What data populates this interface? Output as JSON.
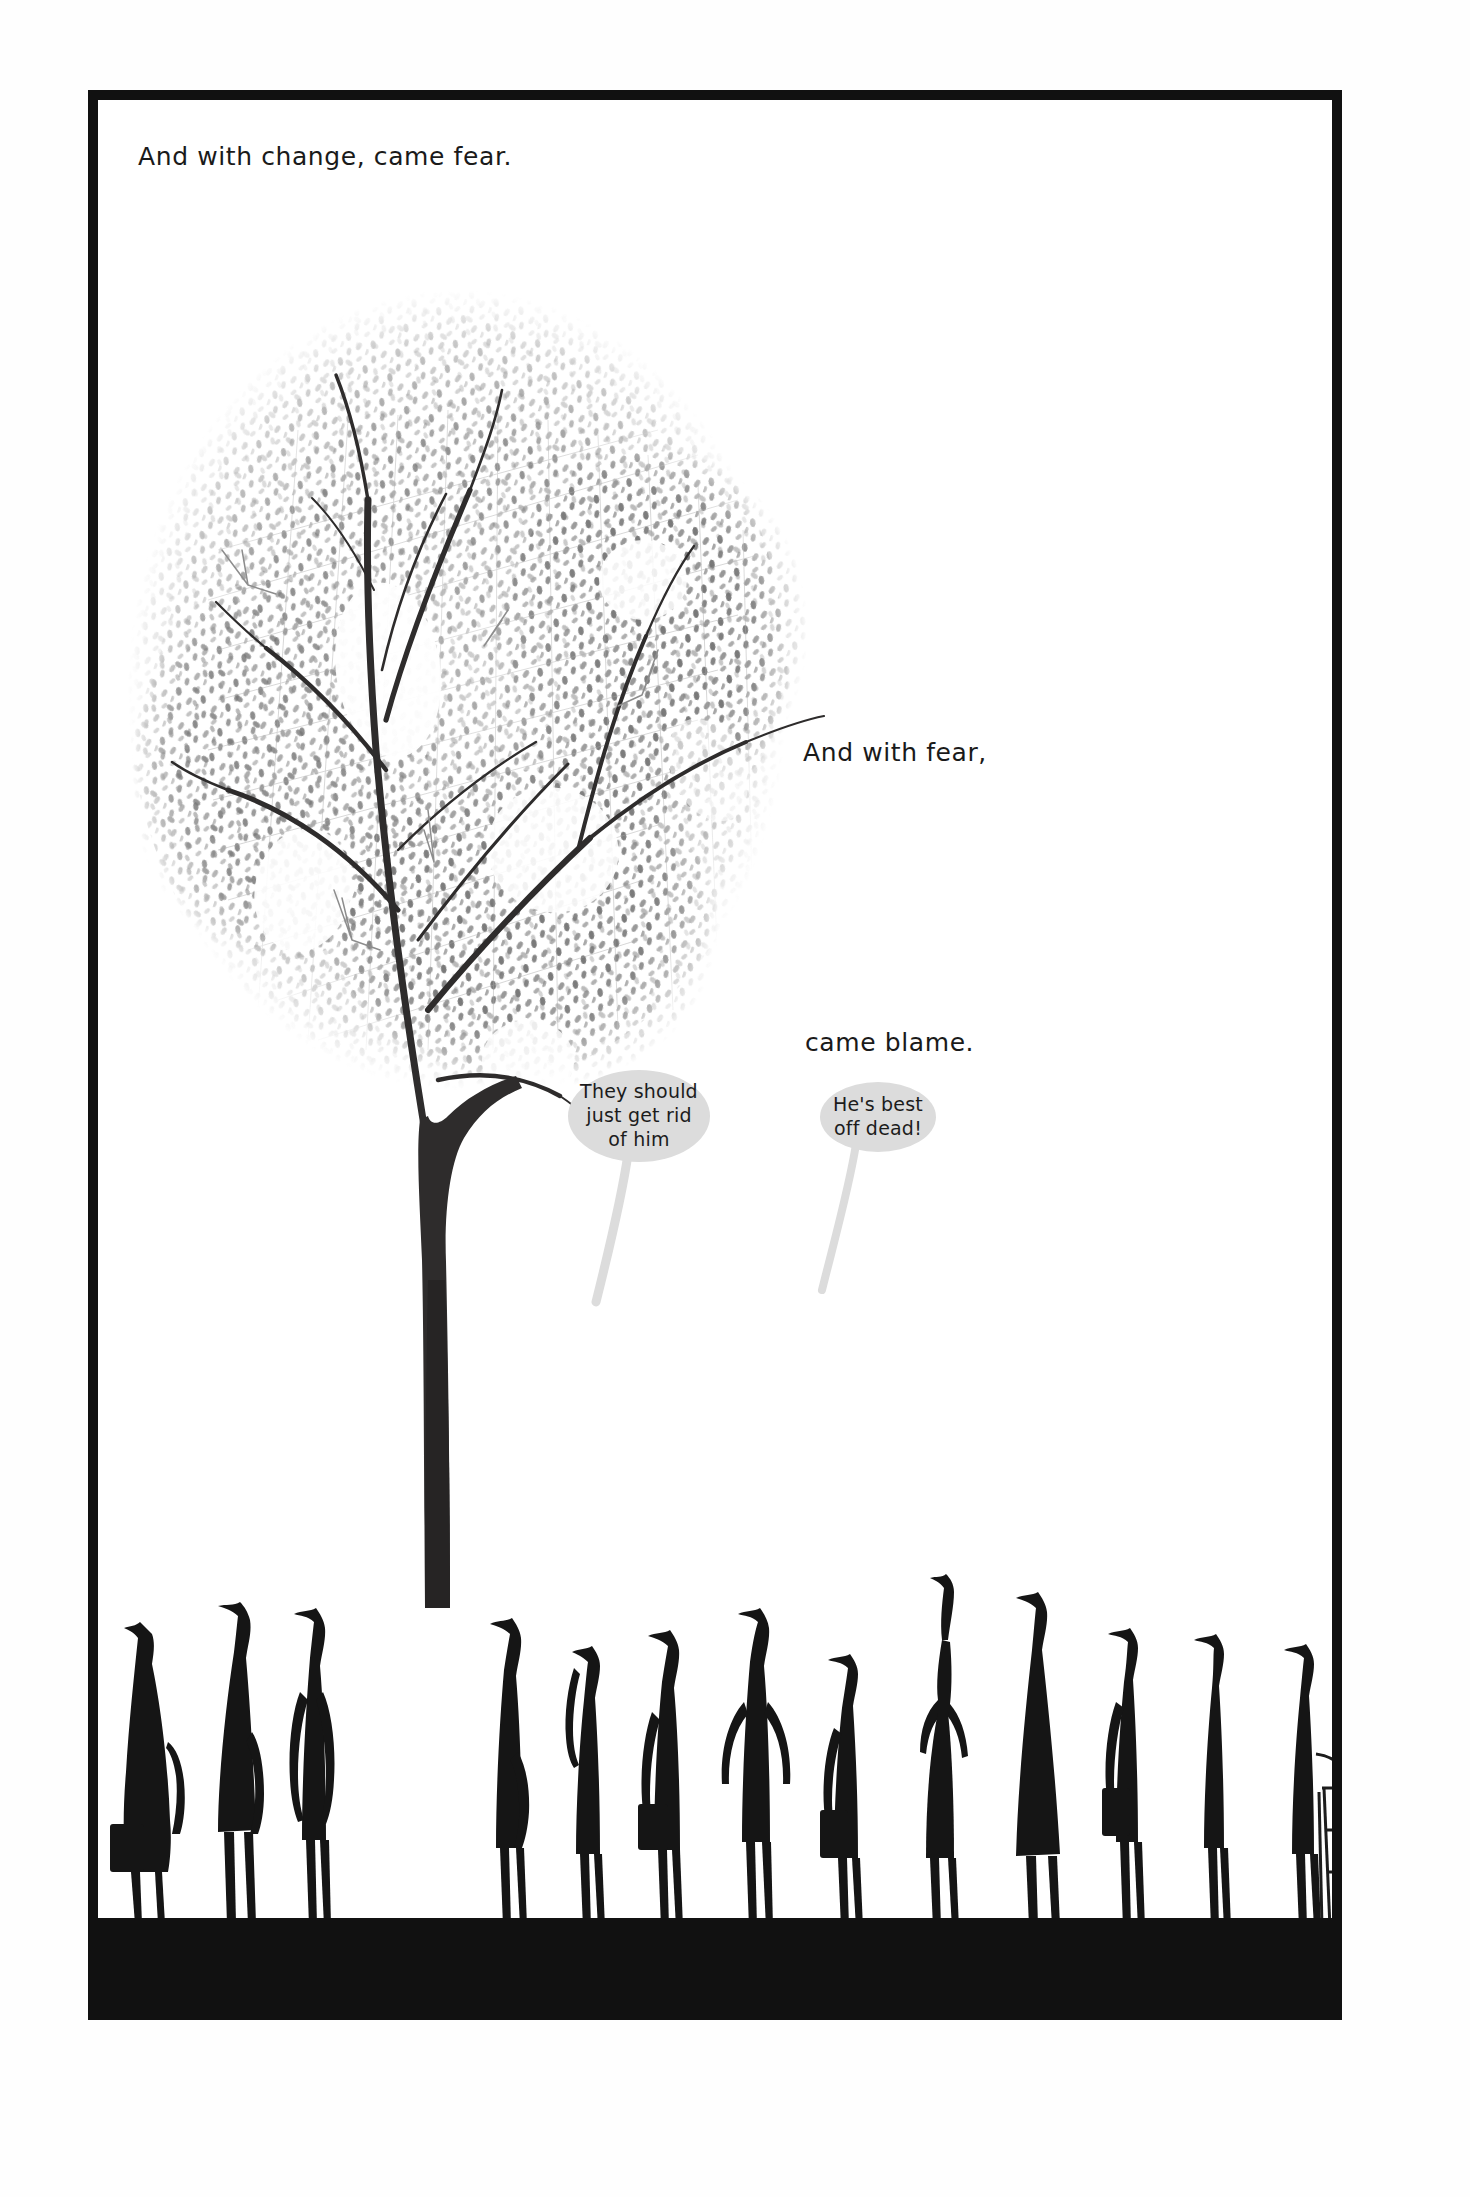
{
  "page": {
    "background_color": "#fefefe",
    "panel_border_color": "#111111",
    "ink_color": "#1a1a1a"
  },
  "captions": [
    {
      "id": "caption-change-fear",
      "text": "And with change, came fear."
    },
    {
      "id": "caption-and-with-fear",
      "text": "And with fear,"
    },
    {
      "id": "caption-came-blame",
      "text": "came blame."
    }
  ],
  "speech_bubbles": [
    {
      "id": "bubble-they-should",
      "text": "They should just get rid of him",
      "lines": [
        "They should",
        "just get rid",
        "of him"
      ],
      "fill_color": "#dcdcdc"
    },
    {
      "id": "bubble-hes-best-off-dead",
      "text": "He's best off dead!",
      "lines": [
        "He's best",
        "off dead!"
      ],
      "fill_color": "#dcdcdc"
    }
  ],
  "artwork": {
    "tree": {
      "label": "large pencil-drawn tree with stippled foliage",
      "trunk_color": "#3a3a3a",
      "foliage_color": "#9a9a9a"
    },
    "ground": {
      "label": "solid black ground strip",
      "color": "#111111"
    },
    "crowd": {
      "label": "row of elongated black silhouette figures",
      "color": "#151515",
      "figure_count": 14,
      "figures": [
        {
          "name": "figure-1-briefcase",
          "prop": "briefcase"
        },
        {
          "name": "figure-2-hat",
          "prop": "none"
        },
        {
          "name": "figure-3-looking-up",
          "prop": "none"
        },
        {
          "name": "figure-4-tall",
          "prop": "none"
        },
        {
          "name": "figure-5-long-hair",
          "prop": "none"
        },
        {
          "name": "figure-6-briefcase",
          "prop": "briefcase"
        },
        {
          "name": "figure-7-hands-on-hips",
          "prop": "none"
        },
        {
          "name": "figure-8-briefcase",
          "prop": "briefcase"
        },
        {
          "name": "figure-9-raised-arm",
          "prop": "raised arm"
        },
        {
          "name": "figure-10-tall-cloak",
          "prop": "none"
        },
        {
          "name": "figure-11-briefcase",
          "prop": "briefcase"
        },
        {
          "name": "figure-12-thin",
          "prop": "none"
        },
        {
          "name": "figure-13-ladder",
          "prop": "step ladder"
        },
        {
          "name": "figure-14-small",
          "prop": "none"
        }
      ]
    }
  }
}
